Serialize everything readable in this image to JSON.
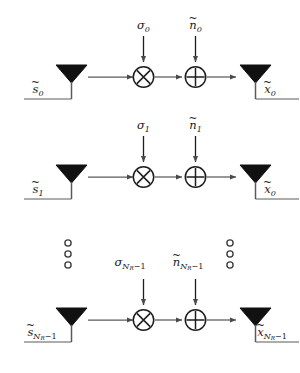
{
  "figure": {
    "type": "block-diagram",
    "background_color": "#ffffff",
    "line_color": "#5a5a5a",
    "text_color": "#1b1b1b",
    "antenna_fill": "#111111"
  },
  "symbols": {
    "tilde": "~",
    "sigma": "σ",
    "n": "n",
    "s": "s",
    "x": "x",
    "N": "N",
    "R": "R",
    "minus_one": "−1",
    "multiply_glyph": "✕",
    "plus_glyph": "+",
    "ellipsis_dot": "○"
  },
  "rows": [
    {
      "id": "row-0",
      "index_label": "0",
      "input": {
        "label_base": "s",
        "label_sub": "0",
        "accent": "~",
        "full_text": "s̃0"
      },
      "gain": {
        "label_base": "σ",
        "label_sub": "0",
        "accent": "",
        "full_text": "σ0"
      },
      "noise": {
        "label_base": "n",
        "label_sub": "0",
        "accent": "~",
        "full_text": "ñ0"
      },
      "output": {
        "label_base": "x",
        "label_sub": "0",
        "accent": "~",
        "full_text": "x̃0"
      },
      "operators": {
        "multiplier": "⊗",
        "adder": "⊕"
      }
    },
    {
      "id": "row-1",
      "index_label": "1",
      "input": {
        "label_base": "s",
        "label_sub": "1",
        "accent": "~",
        "full_text": "s̃1"
      },
      "gain": {
        "label_base": "σ",
        "label_sub": "1",
        "accent": "",
        "full_text": "σ1"
      },
      "noise": {
        "label_base": "n",
        "label_sub": "1",
        "accent": "~",
        "full_text": "ñ1"
      },
      "output": {
        "label_base": "x",
        "label_sub": "0",
        "accent": "~",
        "full_text": "x̃0"
      },
      "operators": {
        "multiplier": "⊗",
        "adder": "⊕"
      }
    },
    {
      "id": "row-nr",
      "index_label": "N_R−1",
      "input": {
        "label_base": "s",
        "label_sub": "N_R−1",
        "accent": "~",
        "full_text": "s̃N_R−1"
      },
      "gain": {
        "label_base": "σ",
        "label_sub": "N_R−1",
        "accent": "",
        "full_text": "σN_R−1"
      },
      "noise": {
        "label_base": "n",
        "label_sub": "N_R−1",
        "accent": "~",
        "full_text": "ñN_R−1"
      },
      "output": {
        "label_base": "x",
        "label_sub": "N_R−1",
        "accent": "~",
        "full_text": "x̃N_R−1"
      },
      "operators": {
        "multiplier": "⊗",
        "adder": "⊕"
      }
    }
  ],
  "ellipsis": {
    "left": {
      "dot_count": 3,
      "style": "hollow-circle"
    },
    "right": {
      "dot_count": 3,
      "style": "hollow-circle"
    }
  }
}
